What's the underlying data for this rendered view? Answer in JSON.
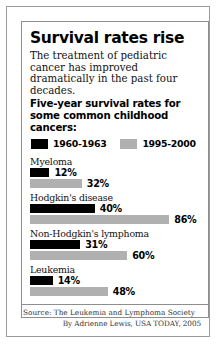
{
  "headline": "Survival rates rise",
  "deck": "The treatment of pediatric cancer has improved dramatically in the past four decades.",
  "subhead": "Five-year survival rates for some common childhood cancers:",
  "legend": {
    "series": [
      {
        "label": "1960-1963",
        "color": "#000000",
        "swatch_name": "legend-swatch-1960-1963"
      },
      {
        "label": "1995-2000",
        "color": "#b0b0b0",
        "swatch_name": "legend-swatch-1995-2000"
      }
    ]
  },
  "source": "Source: The Leukemia and Lymphoma Society",
  "byline": "By Adrienne Lewis, USA TODAY, 2005",
  "chart_data": {
    "type": "bar",
    "title": "Survival rates rise",
    "subtitle": "Five-year survival rates for some common childhood cancers:",
    "xlabel": "",
    "ylabel": "",
    "xlim": [
      0,
      100
    ],
    "unit": "%",
    "orientation": "horizontal",
    "grid": false,
    "legend_position": "top",
    "categories": [
      "Myeloma",
      "Hodgkin's disease",
      "Non-Hodgkin's lymphoma",
      "Leukemia"
    ],
    "series": [
      {
        "name": "1960-1963",
        "color": "#000000",
        "values": [
          12,
          40,
          31,
          14
        ],
        "labels": [
          "12%",
          "40%",
          "31%",
          "14%"
        ]
      },
      {
        "name": "1995-2000",
        "color": "#b0b0b0",
        "values": [
          32,
          86,
          60,
          48
        ],
        "labels": [
          "32%",
          "86%",
          "60%",
          "48%"
        ]
      }
    ],
    "rows": [
      {
        "category": "Myeloma",
        "bars": [
          {
            "series": "1960-1963",
            "value": 12,
            "label": "12%",
            "color": "#000000"
          },
          {
            "series": "1995-2000",
            "value": 32,
            "label": "32%",
            "color": "#b0b0b0"
          }
        ]
      },
      {
        "category": "Hodgkin's disease",
        "bars": [
          {
            "series": "1960-1963",
            "value": 40,
            "label": "40%",
            "color": "#000000"
          },
          {
            "series": "1995-2000",
            "value": 86,
            "label": "86%",
            "color": "#b0b0b0"
          }
        ]
      },
      {
        "category": "Non-Hodgkin's lymphoma",
        "bars": [
          {
            "series": "1960-1963",
            "value": 31,
            "label": "31%",
            "color": "#000000"
          },
          {
            "series": "1995-2000",
            "value": 60,
            "label": "60%",
            "color": "#b0b0b0"
          }
        ]
      },
      {
        "category": "Leukemia",
        "bars": [
          {
            "series": "1960-1963",
            "value": 14,
            "label": "14%",
            "color": "#000000"
          },
          {
            "series": "1995-2000",
            "value": 48,
            "label": "48%",
            "color": "#b0b0b0"
          }
        ]
      }
    ]
  },
  "scale": {
    "px_per_percent": 1.62
  }
}
